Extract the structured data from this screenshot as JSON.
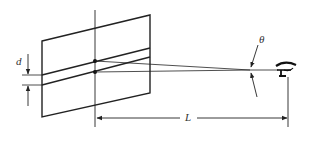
{
  "diagram": {
    "labels": {
      "separation": "d",
      "angle": "θ",
      "distance": "L"
    },
    "elements": [
      "parallelogram-screen",
      "two-parallel-lines",
      "vertical-axis",
      "two-source-dots",
      "converging-rays",
      "angle-marker",
      "eye-observer",
      "separation-dimension",
      "distance-dimension"
    ],
    "colors": {
      "stroke": "#222222",
      "background": "#ffffff"
    }
  }
}
